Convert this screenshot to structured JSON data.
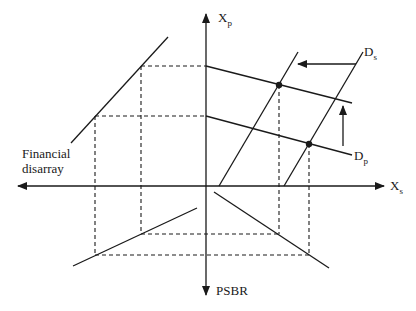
{
  "diagram": {
    "axes": {
      "x_positive": "X",
      "x_positive_sub": "s",
      "x_negative": [
        "Financial",
        "disarray"
      ],
      "y_positive": "X",
      "y_positive_sub": "p",
      "y_negative": "PSBR"
    },
    "curves": {
      "ds_label": "D",
      "ds_sub": "s",
      "dp_label": "D",
      "dp_sub": "p"
    },
    "colors": {
      "ink": "#1a1a1a",
      "background": "#ffffff"
    }
  }
}
